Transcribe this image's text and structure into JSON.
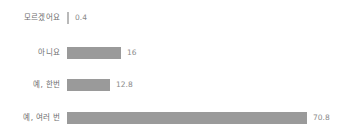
{
  "chart_data": {
    "type": "bar",
    "orientation": "horizontal",
    "title": "",
    "xlabel": "",
    "ylabel": "",
    "grid": false,
    "legend": false,
    "xlim": [
      0,
      70.8
    ],
    "categories": [
      "모르겠어요",
      "아니요",
      "예, 한번",
      "예, 여러 번"
    ],
    "values": [
      0.4,
      16,
      12.8,
      70.8
    ],
    "value_labels": [
      "0.4",
      "16",
      "12.8",
      "70.8"
    ],
    "bar_color": "#9a9a9a",
    "label_color": "#6e6e6e",
    "value_color": "#8a8a8a",
    "background": "#ffffff"
  }
}
